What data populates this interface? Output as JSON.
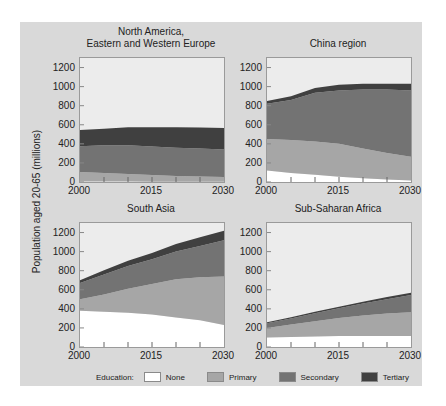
{
  "chart_data": [
    {
      "type": "area",
      "stacked": true,
      "title": "North America, Eastern and Western Europe",
      "x": [
        2000,
        2005,
        2010,
        2015,
        2020,
        2025,
        2030
      ],
      "series": [
        {
          "name": "None",
          "values": [
            5,
            4,
            4,
            3,
            3,
            2,
            2
          ]
        },
        {
          "name": "Primary",
          "values": [
            100,
            90,
            80,
            70,
            60,
            55,
            50
          ]
        },
        {
          "name": "Secondary",
          "values": [
            270,
            290,
            300,
            300,
            295,
            295,
            290
          ]
        },
        {
          "name": "Tertiary",
          "values": [
            170,
            175,
            190,
            200,
            215,
            220,
            225
          ]
        }
      ],
      "xlabel": "",
      "ylabel": "Population aged 20-65 (millions)",
      "ylim": [
        0,
        1300
      ]
    },
    {
      "type": "area",
      "stacked": true,
      "title": "China region",
      "x": [
        2000,
        2005,
        2010,
        2015,
        2020,
        2025,
        2030
      ],
      "series": [
        {
          "name": "None",
          "values": [
            120,
            95,
            75,
            55,
            40,
            25,
            15
          ]
        },
        {
          "name": "Primary",
          "values": [
            330,
            345,
            350,
            345,
            310,
            280,
            250
          ]
        },
        {
          "name": "Secondary",
          "values": [
            370,
            420,
            510,
            560,
            620,
            665,
            695
          ]
        },
        {
          "name": "Tertiary",
          "values": [
            30,
            40,
            50,
            60,
            60,
            60,
            70
          ]
        }
      ],
      "xlabel": "",
      "ylabel": "Population aged 20-65 (millions)",
      "ylim": [
        0,
        1300
      ]
    },
    {
      "type": "area",
      "stacked": true,
      "title": "South Asia",
      "x": [
        2000,
        2005,
        2010,
        2015,
        2020,
        2025,
        2030
      ],
      "series": [
        {
          "name": "None",
          "values": [
            380,
            370,
            360,
            340,
            310,
            280,
            230
          ]
        },
        {
          "name": "Primary",
          "values": [
            120,
            180,
            250,
            320,
            400,
            450,
            510
          ]
        },
        {
          "name": "Secondary",
          "values": [
            170,
            210,
            240,
            260,
            290,
            330,
            380
          ]
        },
        {
          "name": "Tertiary",
          "values": [
            30,
            45,
            55,
            65,
            80,
            90,
            100
          ]
        }
      ],
      "xlabel": "",
      "ylabel": "Population aged 20-65 (millions)",
      "ylim": [
        0,
        1300
      ]
    },
    {
      "type": "area",
      "stacked": true,
      "title": "Sub-Saharan Africa",
      "x": [
        2000,
        2005,
        2010,
        2015,
        2020,
        2025,
        2030
      ],
      "series": [
        {
          "name": "None",
          "values": [
            100,
            105,
            110,
            115,
            115,
            115,
            115
          ]
        },
        {
          "name": "Primary",
          "values": [
            100,
            130,
            160,
            190,
            215,
            235,
            250
          ]
        },
        {
          "name": "Secondary",
          "values": [
            50,
            65,
            85,
            100,
            125,
            150,
            180
          ]
        },
        {
          "name": "Tertiary",
          "values": [
            10,
            12,
            15,
            18,
            20,
            23,
            25
          ]
        }
      ],
      "xlabel": "",
      "ylabel": "Population aged 20-65 (millions)",
      "ylim": [
        0,
        1300
      ]
    }
  ],
  "axis": {
    "y_ticks": [
      "0",
      "200",
      "400",
      "600",
      "800",
      "1000",
      "1200"
    ],
    "x_ticks": [
      "2000",
      "2015",
      "2030"
    ],
    "y_label": "Population aged 20-65 (millions)"
  },
  "panels": [
    {
      "title_line1": "North America,",
      "title_line2": "Eastern and Western Europe"
    },
    {
      "title_line1": "China region",
      "title_line2": ""
    },
    {
      "title_line1": "South Asia",
      "title_line2": ""
    },
    {
      "title_line1": "Sub-Saharan Africa",
      "title_line2": ""
    }
  ],
  "legend": {
    "label": "Education:",
    "items": [
      {
        "name": "None",
        "color": "#ffffff"
      },
      {
        "name": "Primary",
        "color": "#a6a6a6"
      },
      {
        "name": "Secondary",
        "color": "#737373"
      },
      {
        "name": "Tertiary",
        "color": "#404040"
      }
    ]
  },
  "colors": {
    "background": "#d9d9d9",
    "plot_bg": "#ececec",
    "none": "#ffffff",
    "primary": "#a6a6a6",
    "secondary": "#737373",
    "tertiary": "#404040"
  }
}
